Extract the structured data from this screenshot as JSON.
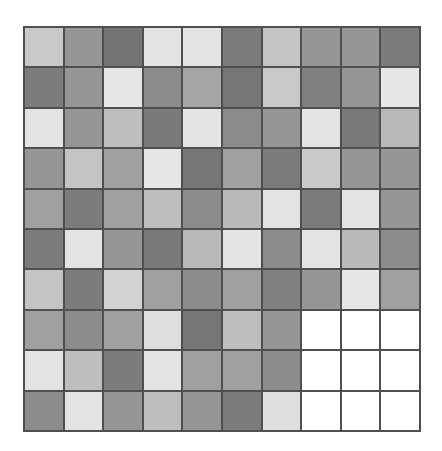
{
  "figure": {
    "kind": "heatmap-grid",
    "background_color": "#ffffff",
    "border_color": "#4f4f4f",
    "border_width_px": 2,
    "gridline_color": "#4f4f4f",
    "gridline_width_px": 2
  },
  "chart_data": {
    "type": "heatmap",
    "title": "",
    "subtitle": "",
    "xlabel": "",
    "ylabel": "",
    "x": [
      1,
      2,
      3,
      4,
      5,
      6,
      7,
      8,
      9,
      10
    ],
    "y": [
      1,
      2,
      3,
      4,
      5,
      6,
      7,
      8,
      9,
      10
    ],
    "xticklabels": [],
    "yticklabels": [],
    "rows": 10,
    "cols": 10,
    "grid": true,
    "legend": "none",
    "colormap": "greys",
    "colorbar": false,
    "value_range": [
      0,
      255
    ],
    "note": "values are 8-bit gray levels; 255 = white/blank cells in lower-right block",
    "palette": {
      "dark": "#737373",
      "medium_dark": "#858585",
      "medium": "#999999",
      "light_medium": "#b3b3b3",
      "light": "#c9c9c9",
      "very_light": "#e3e3e3",
      "blank": "#ffffff"
    },
    "values": [
      [
        201,
        150,
        115,
        227,
        227,
        124,
        196,
        150,
        150,
        124
      ],
      [
        124,
        150,
        230,
        140,
        166,
        118,
        201,
        128,
        150,
        230
      ],
      [
        227,
        150,
        190,
        122,
        227,
        140,
        150,
        227,
        122,
        185
      ],
      [
        150,
        196,
        160,
        230,
        118,
        160,
        124,
        201,
        150,
        150
      ],
      [
        160,
        124,
        160,
        190,
        140,
        185,
        227,
        124,
        227,
        150
      ],
      [
        124,
        227,
        150,
        122,
        185,
        227,
        140,
        227,
        185,
        140
      ],
      [
        196,
        124,
        210,
        160,
        140,
        160,
        128,
        150,
        230,
        160
      ],
      [
        160,
        140,
        160,
        222,
        118,
        190,
        150,
        255,
        255,
        255
      ],
      [
        227,
        190,
        124,
        227,
        160,
        160,
        140,
        255,
        255,
        255
      ],
      [
        140,
        227,
        150,
        190,
        150,
        124,
        222,
        255,
        255,
        255
      ]
    ]
  }
}
